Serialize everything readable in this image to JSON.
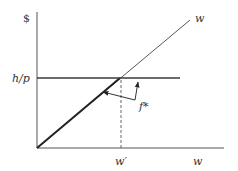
{
  "diagram": {
    "labels": {
      "y_axis": "$",
      "h_over_p": "h/p",
      "diagonal": "w",
      "x_tick": "w′",
      "x_axis": "w",
      "function": "f*"
    },
    "colors": {
      "line": "#333333",
      "background": "#ffffff"
    },
    "elements": {
      "y_axis": "vertical axis ($)",
      "x_axis": "horizontal axis (w)",
      "diagonal_line": "45-degree line w",
      "horizontal_line": "h/p level",
      "dashed_line": "vertical dashed line at w′",
      "f_star": "kinked function f* (bold diagonal segment up to w′, then flat at h/p)"
    }
  }
}
